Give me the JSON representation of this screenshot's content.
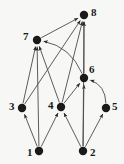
{
  "diagram": {
    "type": "directed-graph",
    "title": "",
    "width": 124,
    "height": 164,
    "background_color": "#f7f7f5",
    "node_color": "#1a1a1a",
    "edge_color": "#4a4a4a",
    "label_color": "#1a1a1a",
    "node_radius": 4.2,
    "nodes": [
      {
        "id": "1",
        "label": "1",
        "x": 39,
        "y": 151,
        "label_x": 27,
        "label_y": 147
      },
      {
        "id": "2",
        "label": "2",
        "x": 83,
        "y": 151,
        "label_x": 90,
        "label_y": 147
      },
      {
        "id": "3",
        "label": "3",
        "x": 22,
        "y": 108,
        "label_x": 9,
        "label_y": 101
      },
      {
        "id": "4",
        "label": "4",
        "x": 61,
        "y": 107,
        "label_x": 48,
        "label_y": 100
      },
      {
        "id": "5",
        "label": "5",
        "x": 106,
        "y": 108,
        "label_x": 112,
        "label_y": 101
      },
      {
        "id": "6",
        "label": "6",
        "x": 84,
        "y": 78,
        "label_x": 89,
        "label_y": 64
      },
      {
        "id": "7",
        "label": "7",
        "x": 37,
        "y": 40,
        "label_x": 23,
        "label_y": 31
      },
      {
        "id": "8",
        "label": "8",
        "x": 84,
        "y": 15,
        "label_x": 91,
        "label_y": 7
      }
    ],
    "edges": [
      {
        "from": "1",
        "to": "3",
        "curved": false,
        "label": ""
      },
      {
        "from": "1",
        "to": "4",
        "curved": false,
        "label": ""
      },
      {
        "from": "1",
        "to": "7",
        "curved": false,
        "label": ""
      },
      {
        "from": "2",
        "to": "4",
        "curved": false,
        "label": ""
      },
      {
        "from": "2",
        "to": "5",
        "curved": false,
        "label": ""
      },
      {
        "from": "2",
        "to": "6",
        "curved": false,
        "label": ""
      },
      {
        "from": "2",
        "to": "8",
        "curved": false,
        "label": ""
      },
      {
        "from": "3",
        "to": "7",
        "curved": false,
        "label": ""
      },
      {
        "from": "3",
        "to": "8",
        "curved": false,
        "label": ""
      },
      {
        "from": "4",
        "to": "6",
        "curved": false,
        "label": ""
      },
      {
        "from": "4",
        "to": "7",
        "curved": false,
        "label": ""
      },
      {
        "from": "4",
        "to": "8",
        "curved": false,
        "label": ""
      },
      {
        "from": "5",
        "to": "6",
        "curved": true,
        "curve_offset": 13,
        "label": ""
      },
      {
        "from": "6",
        "to": "7",
        "curved": true,
        "curve_offset": 16,
        "label": ""
      },
      {
        "from": "6",
        "to": "8",
        "curved": false,
        "label": ""
      },
      {
        "from": "7",
        "to": "8",
        "curved": false,
        "label": ""
      }
    ]
  }
}
